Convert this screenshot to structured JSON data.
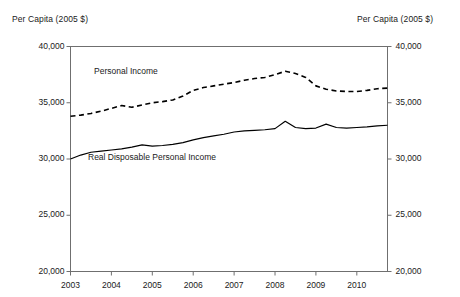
{
  "chart_data": {
    "type": "line",
    "title": "",
    "xlabel": "",
    "ylabel": "Per Capita (2005 $)",
    "ylabel_right": "Per Capita (2005 $)",
    "xlim": [
      2003,
      2010.75
    ],
    "ylim": [
      20000,
      40000
    ],
    "ytick_values": [
      20000,
      25000,
      30000,
      35000,
      40000
    ],
    "ytick_labels": [
      "20,000",
      "25,000",
      "30,000",
      "35,000",
      "40,000"
    ],
    "xtick_values": [
      2003,
      2004,
      2005,
      2006,
      2007,
      2008,
      2009,
      2010
    ],
    "xtick_labels": [
      "2003",
      "2004",
      "2005",
      "2006",
      "2007",
      "2008",
      "2009",
      "2010"
    ],
    "grid": false,
    "legend_position": "inline-annotation",
    "x": [
      2003.0,
      2003.25,
      2003.5,
      2003.75,
      2004.0,
      2004.25,
      2004.5,
      2004.75,
      2005.0,
      2005.25,
      2005.5,
      2005.75,
      2006.0,
      2006.25,
      2006.5,
      2006.75,
      2007.0,
      2007.25,
      2007.5,
      2007.75,
      2008.0,
      2008.25,
      2008.5,
      2008.75,
      2009.0,
      2009.25,
      2009.5,
      2009.75,
      2010.0,
      2010.25,
      2010.5,
      2010.75
    ],
    "series": [
      {
        "name": "Personal Income",
        "style": "dashed",
        "color": "#000000",
        "values": [
          33800,
          33900,
          34050,
          34250,
          34500,
          34750,
          34600,
          34800,
          35000,
          35100,
          35250,
          35600,
          36100,
          36350,
          36500,
          36650,
          36800,
          37000,
          37150,
          37250,
          37500,
          37800,
          37600,
          37250,
          36500,
          36200,
          36050,
          36000,
          36000,
          36100,
          36250,
          36300
        ]
      },
      {
        "name": "Real Disposable Personal Income",
        "style": "solid",
        "color": "#000000",
        "values": [
          30000,
          30350,
          30600,
          30700,
          30800,
          30900,
          31050,
          31250,
          31150,
          31200,
          31300,
          31450,
          31700,
          31900,
          32050,
          32200,
          32400,
          32500,
          32550,
          32600,
          32700,
          33350,
          32800,
          32700,
          32750,
          33100,
          32800,
          32750,
          32800,
          32850,
          32950,
          33000
        ]
      }
    ]
  },
  "labels": {
    "caption_left": "Per Capita (2005 $)",
    "caption_right": "Per Capita (2005 $)",
    "personal_income": "Personal Income",
    "real_disposable": "Real Disposable Personal Income"
  }
}
